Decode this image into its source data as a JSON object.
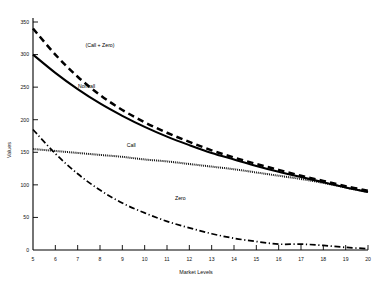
{
  "chart_data": {
    "type": "line",
    "title": "",
    "xlabel": "Market Levels",
    "ylabel": "Values",
    "xlim": [
      5,
      20
    ],
    "ylim": [
      0,
      350
    ],
    "grid": false,
    "legend_position": "inline-annotations",
    "xticks": [
      "5",
      "6",
      "7",
      "8",
      "9",
      "10",
      "11",
      "12",
      "13",
      "14",
      "15",
      "16",
      "17",
      "18",
      "19",
      "20"
    ],
    "yticks": [
      "0",
      "50",
      "100",
      "150",
      "200",
      "250",
      "300",
      "350"
    ],
    "x": [
      5,
      6,
      7,
      8,
      9,
      10,
      11,
      12,
      13,
      14,
      15,
      16,
      17,
      18,
      19,
      20
    ],
    "series": [
      {
        "name": "(Call + Zero)",
        "style": "dashed-thick",
        "label_x": 8.0,
        "label_y": 312,
        "values": [
          340,
          300,
          266,
          238,
          215,
          196,
          180,
          166,
          153,
          142,
          132,
          123,
          114,
          106,
          98,
          91
        ]
      },
      {
        "name": "Noncall",
        "style": "solid-thick",
        "label_x": 7.4,
        "label_y": 248,
        "values": [
          300,
          272,
          247,
          225,
          206,
          189,
          174,
          161,
          149,
          139,
          129,
          120,
          112,
          104,
          96,
          89
        ]
      },
      {
        "name": "Call",
        "style": "dotted",
        "label_x": 9.4,
        "label_y": 158,
        "values": [
          155,
          152,
          149,
          146,
          143,
          139,
          136,
          132,
          128,
          124,
          119,
          114,
          109,
          103,
          96,
          89
        ]
      },
      {
        "name": "Zero",
        "style": "dash-dot",
        "label_x": 11.6,
        "label_y": 77,
        "values": [
          185,
          148,
          117,
          92,
          72,
          57,
          44,
          34,
          25,
          18,
          13,
          9,
          9,
          7,
          4,
          2
        ]
      }
    ]
  }
}
